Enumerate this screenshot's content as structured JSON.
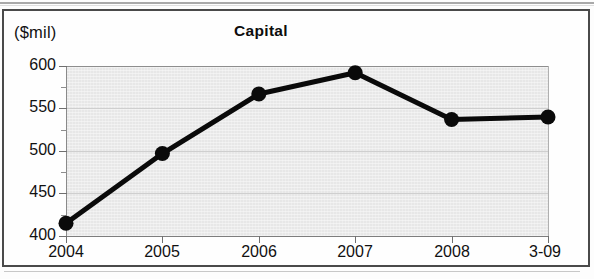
{
  "figure": {
    "unit_label": "($mil)",
    "title": "Capital"
  },
  "axes": {
    "y_tick_labels": [
      "600",
      "550",
      "500",
      "450",
      "400"
    ],
    "x_tick_labels": [
      "2004",
      "2005",
      "2006",
      "2007",
      "2008",
      "3-09"
    ]
  },
  "chart_data": {
    "type": "line",
    "title": "Capital",
    "xlabel": "",
    "ylabel": "($mil)",
    "categories": [
      "2004",
      "2005",
      "2006",
      "2007",
      "2008",
      "3-09"
    ],
    "values": [
      415,
      497,
      567,
      592,
      537,
      540
    ],
    "ylim": [
      400,
      600
    ],
    "y_major_ticks": [
      400,
      450,
      500,
      550,
      600
    ],
    "y_minor_ticks": [
      425,
      475,
      525,
      575
    ],
    "grid": true,
    "legend": false,
    "series": [
      {
        "name": "Capital",
        "values": [
          415,
          497,
          567,
          592,
          537,
          540
        ],
        "color": "#0a0a0a",
        "marker": "circle",
        "line_width": 5
      }
    ],
    "colors": {
      "line": "#0a0a0a",
      "marker": "#0a0a0a",
      "plot_background": "#e7e7e7",
      "gridline": "#cfcfcf",
      "axis": "#7d7d7d",
      "border": "#4a4a4a",
      "text": "#111111"
    }
  }
}
